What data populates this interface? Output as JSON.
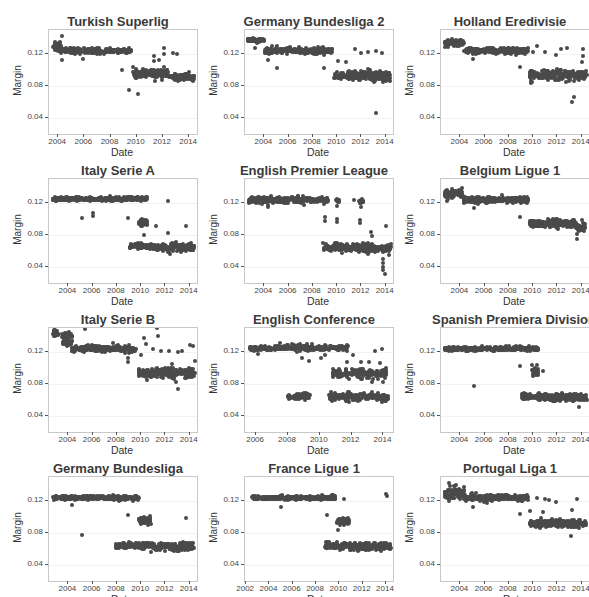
{
  "chart_data": [
    {
      "type": "scatter",
      "title": "Turkish Superlig",
      "xlabel": "Date",
      "ylabel": "Margin",
      "x_ticks": [
        "2004",
        "2006",
        "2008",
        "2010",
        "2012",
        "2014"
      ],
      "y_ticks": [
        "0.04",
        "0.08",
        "0.12"
      ],
      "xlim": [
        2003.3,
        2014.6
      ],
      "ylim": [
        0.02,
        0.15
      ],
      "clusters": [
        {
          "x0": 2003.6,
          "x1": 2004.2,
          "y": 0.13,
          "spread": 0.006
        },
        {
          "x0": 2004.2,
          "x1": 2007.3,
          "y": 0.124,
          "spread": 0.003
        },
        {
          "x0": 2007.5,
          "x1": 2009.6,
          "y": 0.124,
          "spread": 0.002
        },
        {
          "x0": 2009.7,
          "x1": 2012.5,
          "y": 0.095,
          "spread": 0.005
        },
        {
          "x0": 2012.6,
          "x1": 2014.4,
          "y": 0.091,
          "spread": 0.003
        }
      ],
      "outliers": [
        [
          2004.3,
          0.143
        ],
        [
          2004.3,
          0.112
        ],
        [
          2005.9,
          0.114
        ],
        [
          2008.9,
          0.1
        ],
        [
          2009.4,
          0.075
        ],
        [
          2010.1,
          0.07
        ],
        [
          2011.3,
          0.118
        ],
        [
          2011.3,
          0.111
        ],
        [
          2011.7,
          0.113
        ],
        [
          2012.1,
          0.127
        ],
        [
          2012.1,
          0.12
        ],
        [
          2012.8,
          0.121
        ],
        [
          2013.1,
          0.12
        ],
        [
          2014.0,
          0.098
        ]
      ]
    },
    {
      "type": "scatter",
      "title": "Germany Bundesliga 2",
      "xlabel": "Date",
      "ylabel": "Margin",
      "x_ticks": [
        "2004",
        "2006",
        "2008",
        "2010",
        "2012",
        "2014"
      ],
      "y_ticks": [
        "0.04",
        "0.08",
        "0.12"
      ],
      "xlim": [
        2002.4,
        2014.6
      ],
      "ylim": [
        0.02,
        0.15
      ],
      "clusters": [
        {
          "x0": 2002.6,
          "x1": 2004.0,
          "y": 0.137,
          "spread": 0.002
        },
        {
          "x0": 2004.0,
          "x1": 2009.6,
          "y": 0.124,
          "spread": 0.003
        },
        {
          "x0": 2009.7,
          "x1": 2014.4,
          "y": 0.093,
          "spread": 0.005
        }
      ],
      "outliers": [
        [
          2003.2,
          0.128
        ],
        [
          2004.3,
          0.112
        ],
        [
          2005.0,
          0.103
        ],
        [
          2008.9,
          0.102
        ],
        [
          2010.1,
          0.111
        ],
        [
          2010.7,
          0.11
        ],
        [
          2011.5,
          0.126
        ],
        [
          2012.0,
          0.121
        ],
        [
          2012.5,
          0.122
        ],
        [
          2013.2,
          0.046
        ],
        [
          2013.2,
          0.124
        ],
        [
          2013.7,
          0.121
        ]
      ]
    },
    {
      "type": "scatter",
      "title": "Holland Eredivisie",
      "xlabel": "Date",
      "ylabel": "Margin",
      "x_ticks": [
        "2004",
        "2006",
        "2008",
        "2010",
        "2012",
        "2014"
      ],
      "y_ticks": [
        "0.04",
        "0.08",
        "0.12"
      ],
      "xlim": [
        2002.4,
        2014.6
      ],
      "ylim": [
        0.02,
        0.15
      ],
      "clusters": [
        {
          "x0": 2002.7,
          "x1": 2004.3,
          "y": 0.133,
          "spread": 0.004
        },
        {
          "x0": 2004.3,
          "x1": 2009.6,
          "y": 0.124,
          "spread": 0.003
        },
        {
          "x0": 2009.7,
          "x1": 2014.4,
          "y": 0.094,
          "spread": 0.005
        }
      ],
      "outliers": [
        [
          2005.0,
          0.114
        ],
        [
          2008.9,
          0.104
        ],
        [
          2009.8,
          0.085
        ],
        [
          2010.0,
          0.122
        ],
        [
          2010.3,
          0.13
        ],
        [
          2011.0,
          0.122
        ],
        [
          2011.9,
          0.119
        ],
        [
          2012.3,
          0.126
        ],
        [
          2012.8,
          0.127
        ],
        [
          2013.2,
          0.06
        ],
        [
          2013.4,
          0.066
        ],
        [
          2014.1,
          0.126
        ],
        [
          2014.1,
          0.118
        ],
        [
          2014.0,
          0.11
        ]
      ]
    },
    {
      "type": "scatter",
      "title": "Italy Serie A",
      "xlabel": "Date",
      "ylabel": "Margin",
      "x_ticks": [
        "2004",
        "2006",
        "2008",
        "2010",
        "2012",
        "2014"
      ],
      "y_ticks": [
        "0.04",
        "0.08",
        "0.12"
      ],
      "xlim": [
        2002.4,
        2014.6
      ],
      "ylim": [
        0.02,
        0.15
      ],
      "clusters": [
        {
          "x0": 2002.7,
          "x1": 2010.5,
          "y": 0.125,
          "spread": 0.002
        },
        {
          "x0": 2009.8,
          "x1": 2010.5,
          "y": 0.095,
          "spread": 0.004
        },
        {
          "x0": 2009.0,
          "x1": 2010.8,
          "y": 0.066,
          "spread": 0.003
        },
        {
          "x0": 2010.9,
          "x1": 2014.4,
          "y": 0.064,
          "spread": 0.004
        }
      ],
      "outliers": [
        [
          2005.1,
          0.101
        ],
        [
          2006.0,
          0.107
        ],
        [
          2006.0,
          0.104
        ],
        [
          2008.9,
          0.101
        ],
        [
          2010.2,
          0.08
        ],
        [
          2011.2,
          0.091
        ],
        [
          2012.2,
          0.122
        ],
        [
          2012.2,
          0.083
        ],
        [
          2013.7,
          0.091
        ]
      ]
    },
    {
      "type": "scatter",
      "title": "English Premier League",
      "xlabel": "Date",
      "ylabel": "Margin",
      "x_ticks": [
        "2004",
        "2006",
        "2008",
        "2010",
        "2012",
        "2014"
      ],
      "y_ticks": [
        "0.04",
        "0.08",
        "0.12"
      ],
      "xlim": [
        2002.4,
        2014.6
      ],
      "ylim": [
        0.02,
        0.15
      ],
      "clusters": [
        {
          "x0": 2002.7,
          "x1": 2009.3,
          "y": 0.124,
          "spread": 0.003
        },
        {
          "x0": 2009.9,
          "x1": 2010.2,
          "y": 0.123,
          "spread": 0.003
        },
        {
          "x0": 2011.8,
          "x1": 2012.2,
          "y": 0.123,
          "spread": 0.003
        },
        {
          "x0": 2008.9,
          "x1": 2014.4,
          "y": 0.064,
          "spread": 0.004
        }
      ],
      "outliers": [
        [
          2004.3,
          0.115
        ],
        [
          2008.8,
          0.07
        ],
        [
          2009.0,
          0.102
        ],
        [
          2009.0,
          0.097
        ],
        [
          2010.0,
          0.1
        ],
        [
          2010.0,
          0.096
        ],
        [
          2010.0,
          0.116
        ],
        [
          2011.4,
          0.124
        ],
        [
          2011.9,
          0.099
        ],
        [
          2011.9,
          0.095
        ],
        [
          2012.0,
          0.115
        ],
        [
          2012.8,
          0.084
        ],
        [
          2012.9,
          0.079
        ],
        [
          2013.8,
          0.05
        ],
        [
          2013.8,
          0.045
        ],
        [
          2013.8,
          0.04
        ],
        [
          2013.8,
          0.036
        ],
        [
          2013.9,
          0.031
        ],
        [
          2014.0,
          0.091
        ],
        [
          2014.3,
          0.055
        ]
      ]
    },
    {
      "type": "scatter",
      "title": "Belgium Ligue 1",
      "xlabel": "Date",
      "ylabel": "Margin",
      "x_ticks": [
        "2004",
        "2006",
        "2008",
        "2010",
        "2012",
        "2014"
      ],
      "y_ticks": [
        "0.04",
        "0.08",
        "0.12"
      ],
      "xlim": [
        2002.4,
        2014.6
      ],
      "ylim": [
        0.02,
        0.15
      ],
      "clusters": [
        {
          "x0": 2002.7,
          "x1": 2004.2,
          "y": 0.131,
          "spread": 0.005
        },
        {
          "x0": 2004.2,
          "x1": 2009.6,
          "y": 0.124,
          "spread": 0.003
        },
        {
          "x0": 2009.7,
          "x1": 2013.5,
          "y": 0.094,
          "spread": 0.004
        },
        {
          "x0": 2013.5,
          "x1": 2014.3,
          "y": 0.089,
          "spread": 0.004
        }
      ],
      "outliers": [
        [
          2002.9,
          0.123
        ],
        [
          2005.1,
          0.114
        ],
        [
          2008.9,
          0.103
        ],
        [
          2013.6,
          0.075
        ],
        [
          2013.6,
          0.081
        ],
        [
          2014.0,
          0.099
        ]
      ]
    },
    {
      "type": "scatter",
      "title": "Italy Serie B",
      "xlabel": "Date",
      "ylabel": "Margin",
      "x_ticks": [
        "2004",
        "2006",
        "2008",
        "2010",
        "2012",
        "2014"
      ],
      "y_ticks": [
        "0.04",
        "0.08",
        "0.12"
      ],
      "xlim": [
        2002.4,
        2014.6
      ],
      "ylim": [
        0.02,
        0.15
      ],
      "clusters": [
        {
          "x0": 2002.7,
          "x1": 2003.2,
          "y": 0.143,
          "spread": 0.004
        },
        {
          "x0": 2003.5,
          "x1": 2004.3,
          "y": 0.141,
          "spread": 0.004
        },
        {
          "x0": 2003.5,
          "x1": 2004.3,
          "y": 0.132,
          "spread": 0.004
        },
        {
          "x0": 2004.3,
          "x1": 2009.6,
          "y": 0.124,
          "spread": 0.003
        },
        {
          "x0": 2009.8,
          "x1": 2014.4,
          "y": 0.094,
          "spread": 0.005
        }
      ],
      "outliers": [
        [
          2005.4,
          0.149
        ],
        [
          2008.9,
          0.112
        ],
        [
          2008.9,
          0.108
        ],
        [
          2010.0,
          0.116
        ],
        [
          2010.2,
          0.138
        ],
        [
          2010.4,
          0.13
        ],
        [
          2011.0,
          0.124
        ],
        [
          2011.3,
          0.15
        ],
        [
          2011.4,
          0.14
        ],
        [
          2011.6,
          0.121
        ],
        [
          2012.3,
          0.121
        ],
        [
          2012.5,
          0.105
        ],
        [
          2012.9,
          0.082
        ],
        [
          2013.0,
          0.074
        ],
        [
          2013.0,
          0.12
        ],
        [
          2013.4,
          0.121
        ],
        [
          2014.0,
          0.129
        ],
        [
          2014.3,
          0.128
        ],
        [
          2014.4,
          0.109
        ]
      ]
    },
    {
      "type": "scatter",
      "title": "English Conference",
      "xlabel": "Date",
      "ylabel": "Margin",
      "x_ticks": [
        "2006",
        "2008",
        "2010",
        "2012",
        "2014"
      ],
      "y_ticks": [
        "0.04",
        "0.08",
        "0.12"
      ],
      "xlim": [
        2005.3,
        2014.6
      ],
      "ylim": [
        0.02,
        0.15
      ],
      "clusters": [
        {
          "x0": 2005.6,
          "x1": 2011.8,
          "y": 0.125,
          "spread": 0.003
        },
        {
          "x0": 2010.8,
          "x1": 2014.2,
          "y": 0.093,
          "spread": 0.005
        },
        {
          "x0": 2008.0,
          "x1": 2009.4,
          "y": 0.064,
          "spread": 0.003
        },
        {
          "x0": 2010.6,
          "x1": 2014.3,
          "y": 0.064,
          "spread": 0.004
        }
      ],
      "outliers": [
        [
          2006.1,
          0.118
        ],
        [
          2008.9,
          0.113
        ],
        [
          2009.3,
          0.109
        ],
        [
          2010.1,
          0.113
        ],
        [
          2010.3,
          0.116
        ],
        [
          2011.7,
          0.108
        ],
        [
          2012.1,
          0.116
        ],
        [
          2012.6,
          0.108
        ],
        [
          2013.1,
          0.108
        ],
        [
          2013.3,
          0.082
        ],
        [
          2013.5,
          0.121
        ],
        [
          2013.8,
          0.106
        ],
        [
          2013.9,
          0.124
        ],
        [
          2014.0,
          0.082
        ]
      ]
    },
    {
      "type": "scatter",
      "title": "Spanish Premiera Division",
      "xlabel": "Date",
      "ylabel": "Margin",
      "x_ticks": [
        "2004",
        "2006",
        "2008",
        "2010",
        "2012",
        "2014"
      ],
      "y_ticks": [
        "0.04",
        "0.08",
        "0.12"
      ],
      "xlim": [
        2002.4,
        2014.6
      ],
      "ylim": [
        0.02,
        0.15
      ],
      "clusters": [
        {
          "x0": 2002.7,
          "x1": 2010.4,
          "y": 0.124,
          "spread": 0.002
        },
        {
          "x0": 2009.9,
          "x1": 2010.4,
          "y": 0.097,
          "spread": 0.005
        },
        {
          "x0": 2009.0,
          "x1": 2010.8,
          "y": 0.064,
          "spread": 0.003
        },
        {
          "x0": 2010.8,
          "x1": 2014.4,
          "y": 0.063,
          "spread": 0.004
        }
      ],
      "outliers": [
        [
          2005.1,
          0.078
        ],
        [
          2008.9,
          0.102
        ],
        [
          2010.8,
          0.096
        ],
        [
          2013.8,
          0.051
        ]
      ]
    },
    {
      "type": "scatter",
      "title": "Germany Bundesliga",
      "xlabel": "Date",
      "ylabel": "Margin",
      "x_ticks": [
        "2004",
        "2006",
        "2008",
        "2010",
        "2012",
        "2014"
      ],
      "y_ticks": [
        "0.04",
        "0.08",
        "0.12"
      ],
      "xlim": [
        2002.4,
        2014.6
      ],
      "ylim": [
        0.02,
        0.15
      ],
      "clusters": [
        {
          "x0": 2002.7,
          "x1": 2009.8,
          "y": 0.124,
          "spread": 0.002
        },
        {
          "x0": 2009.8,
          "x1": 2010.8,
          "y": 0.096,
          "spread": 0.004
        },
        {
          "x0": 2007.9,
          "x1": 2010.8,
          "y": 0.064,
          "spread": 0.003
        },
        {
          "x0": 2010.8,
          "x1": 2014.4,
          "y": 0.063,
          "spread": 0.004
        }
      ],
      "outliers": [
        [
          2004.3,
          0.115
        ],
        [
          2005.1,
          0.078
        ],
        [
          2008.9,
          0.103
        ],
        [
          2013.7,
          0.099
        ]
      ]
    },
    {
      "type": "scatter",
      "title": "France Ligue 1",
      "xlabel": "Date",
      "ylabel": "Margin",
      "x_ticks": [
        "2002",
        "2004",
        "2006",
        "2008",
        "2010",
        "2012",
        "2014"
      ],
      "y_ticks": [
        "0.04",
        "0.08",
        "0.12"
      ],
      "xlim": [
        2001.9,
        2014.6
      ],
      "ylim": [
        0.02,
        0.15
      ],
      "clusters": [
        {
          "x0": 2002.5,
          "x1": 2009.7,
          "y": 0.124,
          "spread": 0.002
        },
        {
          "x0": 2009.8,
          "x1": 2010.8,
          "y": 0.094,
          "spread": 0.004
        },
        {
          "x0": 2008.8,
          "x1": 2010.8,
          "y": 0.064,
          "spread": 0.003
        },
        {
          "x0": 2010.8,
          "x1": 2014.4,
          "y": 0.063,
          "spread": 0.004
        }
      ],
      "outliers": [
        [
          2005.0,
          0.112
        ],
        [
          2008.9,
          0.102
        ],
        [
          2009.9,
          0.084
        ],
        [
          2010.4,
          0.122
        ],
        [
          2014.0,
          0.129
        ],
        [
          2014.1,
          0.126
        ]
      ]
    },
    {
      "type": "scatter",
      "title": "Portugal Liga 1",
      "xlabel": "Date",
      "ylabel": "Margin",
      "x_ticks": [
        "2004",
        "2006",
        "2008",
        "2010",
        "2012",
        "2014"
      ],
      "y_ticks": [
        "0.04",
        "0.08",
        "0.12"
      ],
      "xlim": [
        2002.4,
        2014.6
      ],
      "ylim": [
        0.02,
        0.15
      ],
      "clusters": [
        {
          "x0": 2002.7,
          "x1": 2004.3,
          "y": 0.13,
          "spread": 0.006
        },
        {
          "x0": 2004.3,
          "x1": 2009.6,
          "y": 0.124,
          "spread": 0.003
        },
        {
          "x0": 2009.7,
          "x1": 2014.4,
          "y": 0.092,
          "spread": 0.004
        }
      ],
      "outliers": [
        [
          2003.1,
          0.143
        ],
        [
          2005.0,
          0.113
        ],
        [
          2008.9,
          0.104
        ],
        [
          2009.7,
          0.108
        ],
        [
          2010.3,
          0.124
        ],
        [
          2010.8,
          0.106
        ],
        [
          2011.0,
          0.122
        ],
        [
          2011.3,
          0.121
        ],
        [
          2011.9,
          0.119
        ],
        [
          2013.1,
          0.076
        ],
        [
          2013.2,
          0.109
        ],
        [
          2013.6,
          0.123
        ]
      ]
    }
  ]
}
